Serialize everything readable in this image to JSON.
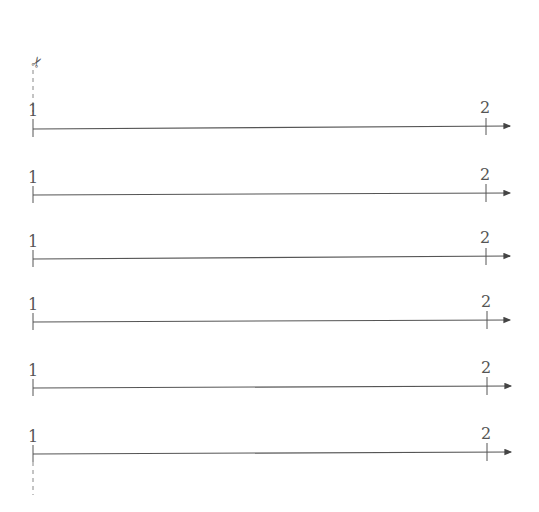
{
  "diagram": {
    "type": "number-line-worksheet",
    "cut_icon": "scissors-icon",
    "cut_glyph": "✂",
    "line_color": "#555555",
    "lines": [
      {
        "start_label": "1",
        "end_label": "2",
        "y": 128
      },
      {
        "start_label": "1",
        "end_label": "2",
        "y": 195
      },
      {
        "start_label": "1",
        "end_label": "2",
        "y": 259
      },
      {
        "start_label": "1",
        "end_label": "2",
        "y": 322
      },
      {
        "start_label": "1",
        "end_label": "2",
        "y": 388
      },
      {
        "start_label": "1",
        "end_label": "2",
        "y": 454
      }
    ]
  }
}
